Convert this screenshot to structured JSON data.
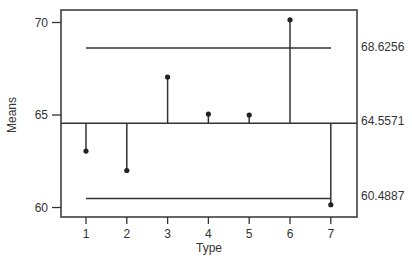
{
  "chart_data": {
    "type": "scatter",
    "title": "",
    "xlabel": "Type",
    "ylabel": "Means",
    "categories": [
      "1",
      "2",
      "3",
      "4",
      "5",
      "6",
      "7"
    ],
    "values": [
      63.05,
      62.0,
      67.05,
      65.05,
      65.0,
      70.15,
      60.15
    ],
    "center_line": 64.5571,
    "upper_decision_limit": 68.6256,
    "lower_decision_limit": 60.4887,
    "center_label": "64.5571",
    "upper_label": "68.6256",
    "lower_label": "60.4887",
    "yticks": [
      "60",
      "65",
      "70"
    ],
    "ylim": [
      59.5,
      70.7
    ],
    "grid": false,
    "legend": "none"
  }
}
